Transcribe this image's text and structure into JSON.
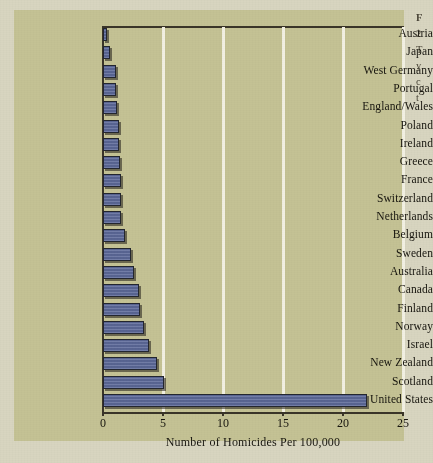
{
  "figure": {
    "background_color": "#d8d5c0",
    "panel_color": "#c4c294",
    "bar_color": "#5d6a9a",
    "gridline_color": "#f2f0e2",
    "axis_color": "#3a3528"
  },
  "caption": {
    "lines": [
      "F",
      "2",
      "T",
      "y",
      "c",
      "t",
      "h"
    ]
  },
  "chart_data": {
    "type": "bar",
    "orientation": "horizontal",
    "title": "",
    "xlabel": "Number of Homicides Per 100,000",
    "ylabel": "",
    "xlim": [
      0,
      25
    ],
    "xticks": [
      0,
      5,
      10,
      15,
      20,
      25
    ],
    "xtick_labels": [
      "0",
      "5",
      "10",
      "15",
      "20",
      "25"
    ],
    "grid": "vertical",
    "legend": "none",
    "categories": [
      "Austria",
      "Japan",
      "West Germany",
      "Portugal",
      "England/Wales",
      "Poland",
      "Ireland",
      "Greece",
      "France",
      "Switzerland",
      "Netherlands",
      "Belgium",
      "Sweden",
      "Australia",
      "Canada",
      "Finland",
      "Norway",
      "Israel",
      "New Zealand",
      "Scotland",
      "United States"
    ],
    "values": [
      0.3,
      0.6,
      1.1,
      1.1,
      1.2,
      1.3,
      1.3,
      1.4,
      1.5,
      1.5,
      1.5,
      1.8,
      2.3,
      2.6,
      3.0,
      3.1,
      3.4,
      3.8,
      4.5,
      5.1,
      22.0
    ]
  }
}
